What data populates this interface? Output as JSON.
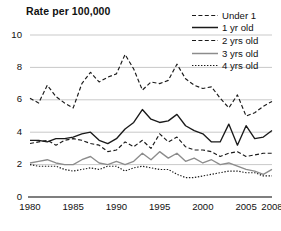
{
  "chart_data": {
    "type": "line",
    "title": "Rate per 100,000",
    "xlabel": "",
    "ylabel": "Rate per 100,000",
    "xlim": [
      1980,
      2008
    ],
    "ylim": [
      0,
      10
    ],
    "ytick_labels": [
      "0",
      "2",
      "4",
      "6",
      "8",
      "10"
    ],
    "ytick_values": [
      0,
      2,
      4,
      6,
      8,
      10
    ],
    "xtick_labels": [
      "1980",
      "1985",
      "1990",
      "1995",
      "2000",
      "2005",
      "2008"
    ],
    "xtick_values": [
      1980,
      1985,
      1990,
      1995,
      2000,
      2005,
      2008
    ],
    "grid": "horizontal",
    "legend_position": "top-right",
    "x": [
      1980,
      1981,
      1982,
      1983,
      1984,
      1985,
      1986,
      1987,
      1988,
      1989,
      1990,
      1991,
      1992,
      1993,
      1994,
      1995,
      1996,
      1997,
      1998,
      1999,
      2000,
      2001,
      2002,
      2003,
      2004,
      2005,
      2006,
      2007,
      2008
    ],
    "series": [
      {
        "name": "Under 1",
        "style": "dashed",
        "color": "#1a1a1a",
        "values": [
          6.1,
          5.8,
          6.9,
          6.2,
          5.8,
          5.5,
          7.0,
          7.7,
          7.1,
          7.4,
          7.6,
          8.8,
          7.9,
          6.6,
          7.1,
          7.0,
          7.2,
          8.2,
          7.3,
          6.9,
          6.7,
          6.8,
          6.1,
          5.5,
          6.3,
          5.0,
          5.2,
          5.6,
          5.9
        ]
      },
      {
        "name": "1 yr old",
        "style": "solid",
        "color": "#1a1a1a",
        "values": [
          3.5,
          3.5,
          3.4,
          3.6,
          3.6,
          3.7,
          3.9,
          4.0,
          3.5,
          3.3,
          3.6,
          4.2,
          4.6,
          5.4,
          4.8,
          4.6,
          4.7,
          5.1,
          4.4,
          4.1,
          3.9,
          3.4,
          3.4,
          4.5,
          3.2,
          4.4,
          3.6,
          3.7,
          4.1
        ]
      },
      {
        "name": "2 yrs old",
        "style": "dashed",
        "color": "#1a1a1a",
        "values": [
          3.3,
          3.4,
          3.5,
          3.2,
          3.5,
          3.6,
          3.5,
          3.3,
          3.2,
          2.8,
          2.9,
          3.4,
          3.1,
          3.5,
          3.0,
          3.9,
          3.4,
          3.7,
          3.1,
          2.9,
          2.9,
          2.8,
          2.5,
          2.7,
          2.8,
          2.5,
          2.6,
          2.7,
          2.7
        ]
      },
      {
        "name": "3 yrs old",
        "style": "solid",
        "color": "#8c8c8c",
        "values": [
          2.1,
          2.2,
          2.3,
          2.1,
          2.0,
          2.0,
          2.3,
          2.5,
          2.1,
          2.0,
          2.2,
          2.0,
          2.2,
          2.7,
          2.3,
          2.8,
          2.4,
          2.7,
          2.2,
          2.4,
          2.1,
          2.3,
          2.0,
          2.1,
          1.9,
          1.7,
          1.6,
          1.4,
          1.7
        ]
      },
      {
        "name": "4 yrs old",
        "style": "dotted",
        "color": "#1a1a1a",
        "values": [
          2.0,
          1.9,
          1.9,
          1.9,
          1.7,
          1.6,
          1.7,
          1.8,
          1.7,
          1.9,
          1.9,
          1.6,
          1.8,
          1.9,
          1.8,
          1.7,
          1.7,
          1.4,
          1.2,
          1.2,
          1.3,
          1.4,
          1.5,
          1.6,
          1.6,
          1.5,
          1.5,
          1.3,
          1.3
        ]
      }
    ]
  }
}
